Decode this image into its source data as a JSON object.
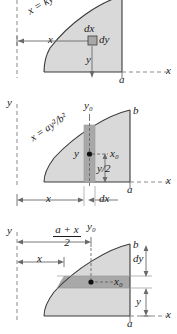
{
  "figure": {
    "colors": {
      "region_fill": "#d9d9d9",
      "element_fill": "#a8a8a8",
      "stroke": "#3a3a3a",
      "dashed": "#8a8a8a",
      "text": "#1a1a1a"
    }
  },
  "panels": [
    {
      "id": "panel-1",
      "curve_label": "x = ky²",
      "axis_x_label": "x",
      "axis_y_label": "",
      "labels": {
        "x_dim": "x",
        "y_dim": "y",
        "dx": "dx",
        "dy": "dy",
        "a": "a"
      }
    },
    {
      "id": "panel-2",
      "curve_label": "x = ay²/b²",
      "axis_x_label": "x",
      "axis_y_label": "y",
      "labels": {
        "y0": "y₀",
        "b": "b",
        "a": "a",
        "y_centroid": "y",
        "x0": "x₀",
        "y_half": "y/2",
        "x_dim": "x",
        "dx": "dx"
      }
    },
    {
      "id": "panel-3",
      "curve_label": "",
      "axis_x_label": "x",
      "axis_y_label": "y",
      "labels": {
        "mid_num": "a + x",
        "mid_den": "2",
        "y0": "y₀",
        "x_dim": "x",
        "b": "b",
        "dy": "dy",
        "x0": "x₀",
        "y_dim": "y",
        "a": "a"
      }
    }
  ]
}
